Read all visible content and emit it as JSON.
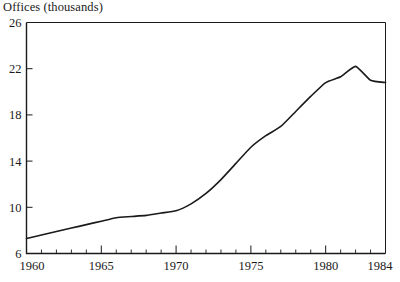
{
  "chart_data": {
    "type": "line",
    "title": "Offices (thousands)",
    "xlabel": "",
    "ylabel": "Offices (thousands)",
    "xlim": [
      1960,
      1984
    ],
    "ylim": [
      6,
      26
    ],
    "yticks": [
      6,
      10,
      14,
      18,
      22,
      26
    ],
    "ytick_labels": [
      "6",
      "10",
      "14",
      "18",
      "22",
      "26"
    ],
    "xticks": [
      1960,
      1965,
      1970,
      1975,
      1980,
      1984
    ],
    "xtick_labels": [
      "1960",
      "1965",
      "1970",
      "1975",
      "1980",
      "1984"
    ],
    "minor_xticks": [
      1961,
      1962,
      1963,
      1964,
      1966,
      1967,
      1968,
      1969,
      1971,
      1972,
      1973,
      1974,
      1976,
      1977,
      1978,
      1979,
      1981,
      1982,
      1983
    ],
    "grid": false,
    "legend": null,
    "line_color": "#1a1a1a",
    "frame_color": "#1a1a1a",
    "x": [
      1960,
      1961,
      1962,
      1963,
      1964,
      1965,
      1966,
      1967,
      1968,
      1969,
      1970,
      1971,
      1972,
      1973,
      1974,
      1975,
      1976,
      1977,
      1978,
      1979,
      1980,
      1981,
      1982,
      1983,
      1984
    ],
    "values": [
      7.3,
      7.6,
      7.9,
      8.2,
      8.5,
      8.8,
      9.1,
      9.2,
      9.3,
      9.5,
      9.7,
      10.3,
      11.2,
      12.4,
      13.8,
      15.2,
      16.2,
      17.0,
      18.3,
      19.6,
      20.8,
      21.3,
      22.2,
      21.0,
      20.8
    ]
  },
  "axis": {
    "title_text": "Offices (thousands)"
  }
}
